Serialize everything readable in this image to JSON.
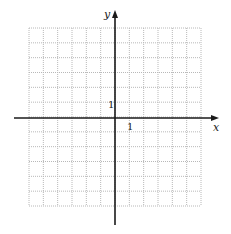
{
  "diagram": {
    "type": "coordinate-plane",
    "grid": {
      "left": 29,
      "top": 28,
      "right": 201,
      "bottom": 206,
      "cols": 12,
      "rows": 12,
      "line_color": "#b8b8b8",
      "style": "dotted"
    },
    "axes": {
      "origin_px": [
        115,
        118
      ],
      "color": "#1a1a1a",
      "x_axis": {
        "start": 14,
        "end": 219,
        "label": "x"
      },
      "y_axis": {
        "start": 225,
        "end": 10,
        "label": "y"
      }
    },
    "tick_labels": {
      "x_unit": "1",
      "y_unit": "1"
    }
  },
  "chart_data": {
    "type": "scatter",
    "title": "",
    "xlabel": "x",
    "ylabel": "y",
    "xlim": [
      -6,
      6
    ],
    "ylim": [
      -6,
      6
    ],
    "grid": true,
    "annotations": [
      "1 (x-axis unit)",
      "1 (y-axis unit)"
    ],
    "series": []
  }
}
